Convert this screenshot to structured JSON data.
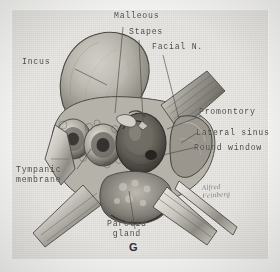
{
  "figure": {
    "id": "G",
    "medium": "halftone pen-and-wash anatomical plate",
    "background_color": "#e8e6e2",
    "ink_color": "#3a3a38",
    "signature": "Alfred\nFeinberg"
  },
  "labels": [
    {
      "key": "malleous",
      "text": "Malleous"
    },
    {
      "key": "stapes",
      "text": "Stapes"
    },
    {
      "key": "facial_n",
      "text": "Facial N."
    },
    {
      "key": "incus",
      "text": "Incus"
    },
    {
      "key": "promontory",
      "text": "Promontory"
    },
    {
      "key": "lateral_sinus",
      "text": "Lateral sinus"
    },
    {
      "key": "round_window",
      "text": "Round window"
    },
    {
      "key": "tympanic_membrane",
      "text": "Tympanic\nmembrane"
    },
    {
      "key": "parotid_gland",
      "text": "Parotid\ngland"
    }
  ],
  "illustration": {
    "structures": [
      "bony canal wall",
      "mastoid air cells",
      "tympanic cavity",
      "ossicular chain",
      "self-retaining retractor blades",
      "soft tissue flaps"
    ]
  }
}
